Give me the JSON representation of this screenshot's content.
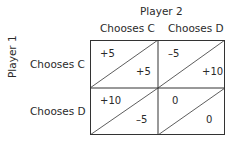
{
  "player2_label": "Player 2",
  "player1_label": "Player 1",
  "columns": [
    "Chooses C",
    "Chooses D"
  ],
  "rows": [
    "Chooses C",
    "Chooses D"
  ],
  "payoffs": [
    [
      {
        "p1": "+5",
        "p2": "+5"
      },
      {
        "p1": "–5",
        "p2": "+10"
      }
    ],
    [
      {
        "p1": "+10",
        "p2": "–5"
      },
      {
        "p1": "0",
        "p2": "0"
      }
    ]
  ]
}
